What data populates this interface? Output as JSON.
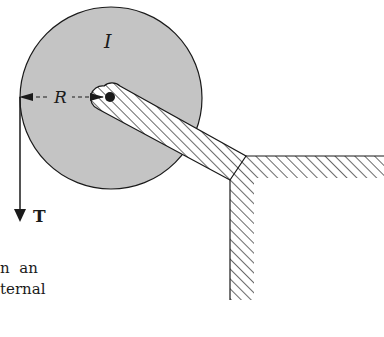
{
  "diagram": {
    "disk_label": "I",
    "radius_label": "R",
    "tension_label": "T",
    "colors": {
      "disk_fill": "#c4c4c4",
      "stroke": "#1a1a1a",
      "background": "#ffffff"
    }
  },
  "caption": {
    "line1": "n  an",
    "line2": "ternal"
  }
}
